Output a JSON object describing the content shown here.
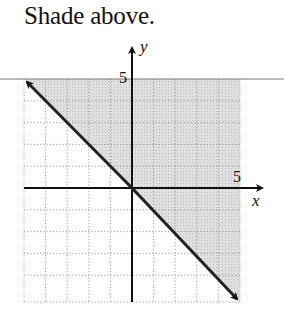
{
  "caption": "Shade above.",
  "graph": {
    "x_axis_label": "x",
    "y_axis_label": "y",
    "x_tick_label": "5",
    "y_tick_label": "5",
    "x_range": [
      -5,
      5
    ],
    "y_range": [
      -5,
      5
    ],
    "grid_step": 1,
    "boundary_line": "y = -x",
    "boundary_style": "solid",
    "shaded_region": "above the line",
    "shade_color": "#d4d4d4",
    "line_color": "#222222"
  }
}
